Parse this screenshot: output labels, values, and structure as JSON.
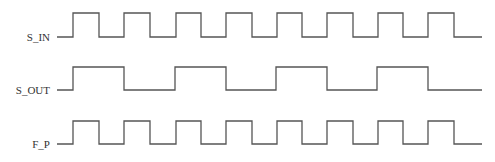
{
  "diagram": {
    "type": "timing-diagram",
    "line_color": "#555555",
    "signals": [
      {
        "name": "S_IN",
        "label_y": 31,
        "high_y": 13,
        "low_y": 37,
        "start_x": 57,
        "end_x": 482,
        "initial": "low",
        "edges": [
          73,
          99,
          124,
          150,
          176,
          201,
          226,
          252,
          277,
          302,
          327,
          353,
          378,
          403,
          428,
          454
        ]
      },
      {
        "name": "S_OUT",
        "label_y": 84,
        "high_y": 67,
        "low_y": 90,
        "start_x": 57,
        "end_x": 482,
        "initial": "low",
        "edges": [
          73,
          124,
          175,
          226,
          276,
          327,
          377,
          428
        ]
      },
      {
        "name": "F_P",
        "label_y": 138,
        "high_y": 121,
        "low_y": 144,
        "start_x": 57,
        "end_x": 482,
        "initial": "low",
        "edges": [
          73,
          99,
          124,
          150,
          176,
          201,
          226,
          252,
          277,
          302,
          327,
          353,
          378,
          403,
          428,
          454
        ]
      }
    ]
  }
}
